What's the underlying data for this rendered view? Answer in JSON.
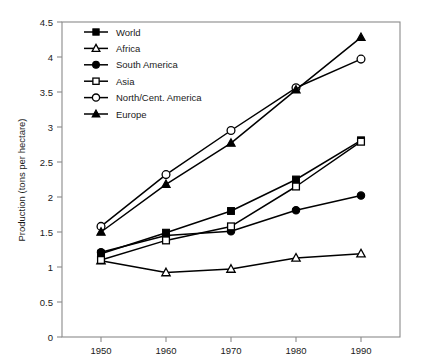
{
  "chart_data": {
    "type": "line",
    "title": "",
    "subtitle": "",
    "xlabel": "",
    "ylabel": "Production (tons per hectare)",
    "x": [
      1950,
      1960,
      1970,
      1980,
      1990
    ],
    "xtick_labels": [
      "1950",
      "1960",
      "1970",
      "1980",
      "1990"
    ],
    "ytick_labels": [
      "0",
      "0.5",
      "1",
      "1.5",
      "2",
      "2.5",
      "3",
      "3.5",
      "4",
      "4.5"
    ],
    "ytick_values": [
      0,
      0.5,
      1,
      1.5,
      2,
      2.5,
      3,
      3.5,
      4,
      4.5
    ],
    "xlim": [
      1944,
      1996
    ],
    "ylim": [
      0,
      4.5
    ],
    "grid": false,
    "legend_position": "top-left",
    "series": [
      {
        "name": "World",
        "marker": "filled-square",
        "values": [
          1.19,
          1.49,
          1.8,
          2.25,
          2.81
        ]
      },
      {
        "name": "Africa",
        "marker": "open-triangle",
        "values": [
          1.09,
          0.92,
          0.97,
          1.13,
          1.19
        ]
      },
      {
        "name": "South America",
        "marker": "filled-circle",
        "values": [
          1.21,
          1.45,
          1.51,
          1.81,
          2.02
        ]
      },
      {
        "name": "Asia",
        "marker": "open-square",
        "values": [
          1.1,
          1.38,
          1.58,
          2.15,
          2.79
        ]
      },
      {
        "name": "North/Cent. America",
        "marker": "open-circle",
        "values": [
          1.58,
          2.32,
          2.95,
          3.56,
          3.97
        ]
      },
      {
        "name": "Europe",
        "marker": "filled-triangle",
        "values": [
          1.5,
          2.18,
          2.77,
          3.53,
          4.28
        ]
      }
    ]
  },
  "colors": {
    "line": "#000000",
    "axis": "#8a8a8a",
    "text": "#1a1a1a",
    "background": "#ffffff"
  }
}
